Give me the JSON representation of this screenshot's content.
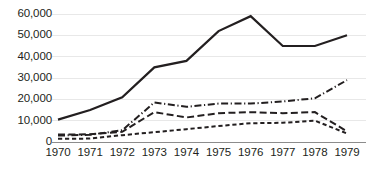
{
  "chart_data": {
    "type": "line",
    "title": "",
    "subtitle": "",
    "xlabel": "",
    "ylabel": "",
    "x": [
      1970,
      1971,
      1972,
      1973,
      1974,
      1975,
      1976,
      1977,
      1978,
      1979
    ],
    "categories": [
      "1970",
      "1971",
      "1972",
      "1973",
      "1974",
      "1975",
      "1976",
      "1977",
      "1978",
      "1979"
    ],
    "xlim": [
      1970,
      1979
    ],
    "ylim": [
      0,
      60000
    ],
    "y_ticks": [
      0,
      10000,
      20000,
      30000,
      40000,
      50000,
      60000
    ],
    "y_tick_labels": [
      "0",
      "10,000",
      "20,000",
      "30,000",
      "40,000",
      "50,000",
      "60,000"
    ],
    "x_ticks": [
      1970,
      1971,
      1972,
      1973,
      1974,
      1975,
      1976,
      1977,
      1978,
      1979
    ],
    "x_tick_labels": [
      "1970",
      "1971",
      "1972",
      "1973",
      "1974",
      "1975",
      "1976",
      "1977",
      "1978",
      "1979"
    ],
    "grid": true,
    "grid_axis": "y",
    "grid_color": "#e8e8e8",
    "axis_color": "#8c8c8c",
    "legend": false,
    "legend_position": "none",
    "series": [
      {
        "name": "series-solid",
        "style": "solid",
        "color": "#231f20",
        "values": [
          10500,
          15000,
          21000,
          35000,
          38000,
          52000,
          59000,
          45000,
          45000,
          50000
        ]
      },
      {
        "name": "series-dash-dot",
        "style": "dash-dot",
        "color": "#231f20",
        "values": [
          3000,
          3400,
          5500,
          18500,
          16500,
          18000,
          18000,
          19000,
          20500,
          29000
        ]
      },
      {
        "name": "series-long-dash",
        "style": "long-dash",
        "color": "#231f20",
        "values": [
          3500,
          3600,
          4800,
          14000,
          11500,
          13500,
          14000,
          13500,
          14000,
          5000
        ]
      },
      {
        "name": "series-short-dash",
        "style": "short-dash",
        "color": "#231f20",
        "values": [
          1500,
          1600,
          3200,
          4600,
          6000,
          7500,
          8800,
          9000,
          10000,
          4000
        ]
      }
    ]
  }
}
